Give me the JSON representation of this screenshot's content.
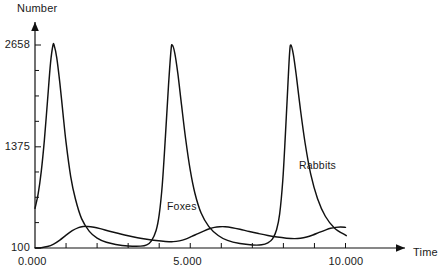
{
  "chart_data": {
    "type": "line",
    "title": "",
    "xlabel": "Time",
    "ylabel": "Number",
    "xlim": [
      0.0,
      12.9
    ],
    "ylim": [
      100,
      2990
    ],
    "grid": false,
    "legend_position": "inline-annotations",
    "x_ticks": [
      {
        "value": 0.0,
        "label": "0.000",
        "labeled": true
      },
      {
        "value": 1.0,
        "label": "",
        "labeled": false
      },
      {
        "value": 2.0,
        "label": "",
        "labeled": false
      },
      {
        "value": 3.0,
        "label": "",
        "labeled": false
      },
      {
        "value": 4.0,
        "label": "",
        "labeled": false
      },
      {
        "value": 5.0,
        "label": "5.000",
        "labeled": true
      },
      {
        "value": 6.0,
        "label": "",
        "labeled": false
      },
      {
        "value": 7.0,
        "label": "",
        "labeled": false
      },
      {
        "value": 8.0,
        "label": "",
        "labeled": false
      },
      {
        "value": 9.0,
        "label": "",
        "labeled": false
      },
      {
        "value": 10.0,
        "label": "10.000",
        "labeled": true
      }
    ],
    "y_ticks": [
      {
        "value": 100,
        "label": "100",
        "labeled": true
      },
      {
        "value": 420,
        "label": "",
        "labeled": false
      },
      {
        "value": 739,
        "label": "",
        "labeled": false
      },
      {
        "value": 1058,
        "label": "",
        "labeled": false
      },
      {
        "value": 1375,
        "label": "1375",
        "labeled": true
      },
      {
        "value": 1696,
        "label": "",
        "labeled": false
      },
      {
        "value": 2016,
        "label": "",
        "labeled": false
      },
      {
        "value": 2337,
        "label": "",
        "labeled": false
      },
      {
        "value": 2658,
        "label": "2658",
        "labeled": true
      }
    ],
    "axis_arrows": {
      "x": true,
      "y": true
    },
    "series": [
      {
        "name": "Rabbits",
        "annotation": "Rabbits",
        "annotation_at": {
          "x": 8.7,
          "y": 1100
        },
        "color": "#111111",
        "points": [
          [
            0.0,
            600
          ],
          [
            0.1,
            780
          ],
          [
            0.2,
            1060
          ],
          [
            0.3,
            1450
          ],
          [
            0.4,
            1940
          ],
          [
            0.5,
            2430
          ],
          [
            0.58,
            2658
          ],
          [
            0.62,
            2650
          ],
          [
            0.7,
            2500
          ],
          [
            0.8,
            2180
          ],
          [
            0.9,
            1800
          ],
          [
            1.0,
            1430
          ],
          [
            1.15,
            1000
          ],
          [
            1.3,
            720
          ],
          [
            1.5,
            470
          ],
          [
            1.75,
            310
          ],
          [
            2.0,
            225
          ],
          [
            2.3,
            172
          ],
          [
            2.6,
            145
          ],
          [
            3.0,
            126
          ],
          [
            3.4,
            124
          ],
          [
            3.6,
            140
          ],
          [
            3.75,
            190
          ],
          [
            3.9,
            320
          ],
          [
            4.0,
            520
          ],
          [
            4.1,
            900
          ],
          [
            4.2,
            1500
          ],
          [
            4.3,
            2150
          ],
          [
            4.38,
            2590
          ],
          [
            4.42,
            2658
          ],
          [
            4.5,
            2560
          ],
          [
            4.6,
            2300
          ],
          [
            4.72,
            1900
          ],
          [
            4.85,
            1480
          ],
          [
            5.0,
            1080
          ],
          [
            5.15,
            790
          ],
          [
            5.35,
            540
          ],
          [
            5.6,
            370
          ],
          [
            5.9,
            258
          ],
          [
            6.2,
            196
          ],
          [
            6.6,
            156
          ],
          [
            7.0,
            138
          ],
          [
            7.3,
            140
          ],
          [
            7.5,
            165
          ],
          [
            7.65,
            215
          ],
          [
            7.78,
            330
          ],
          [
            7.88,
            530
          ],
          [
            7.98,
            950
          ],
          [
            8.06,
            1500
          ],
          [
            8.14,
            2120
          ],
          [
            8.2,
            2560
          ],
          [
            8.24,
            2658
          ],
          [
            8.32,
            2540
          ],
          [
            8.42,
            2260
          ],
          [
            8.55,
            1840
          ],
          [
            8.7,
            1420
          ],
          [
            8.88,
            1030
          ],
          [
            9.1,
            720
          ],
          [
            9.35,
            500
          ],
          [
            9.65,
            350
          ],
          [
            10.0,
            262
          ],
          [
            10.0,
            262
          ]
        ]
      },
      {
        "name": "Foxes",
        "annotation": "Foxes",
        "annotation_at": {
          "x": 4.3,
          "y": 470
        },
        "color": "#111111",
        "points": [
          [
            0.0,
            100
          ],
          [
            0.2,
            104
          ],
          [
            0.4,
            118
          ],
          [
            0.6,
            150
          ],
          [
            0.8,
            200
          ],
          [
            1.0,
            262
          ],
          [
            1.2,
            318
          ],
          [
            1.4,
            356
          ],
          [
            1.55,
            370
          ],
          [
            1.7,
            372
          ],
          [
            1.9,
            362
          ],
          [
            2.1,
            344
          ],
          [
            2.4,
            312
          ],
          [
            2.7,
            282
          ],
          [
            3.0,
            254
          ],
          [
            3.3,
            230
          ],
          [
            3.6,
            210
          ],
          [
            3.9,
            194
          ],
          [
            4.2,
            183
          ],
          [
            4.45,
            180
          ],
          [
            4.65,
            190
          ],
          [
            4.85,
            212
          ],
          [
            5.05,
            246
          ],
          [
            5.25,
            282
          ],
          [
            5.45,
            316
          ],
          [
            5.62,
            342
          ],
          [
            5.78,
            360
          ],
          [
            5.95,
            368
          ],
          [
            6.12,
            368
          ],
          [
            6.35,
            356
          ],
          [
            6.6,
            336
          ],
          [
            6.9,
            308
          ],
          [
            7.2,
            282
          ],
          [
            7.5,
            258
          ],
          [
            7.8,
            238
          ],
          [
            8.1,
            224
          ],
          [
            8.35,
            218
          ],
          [
            8.55,
            222
          ],
          [
            8.75,
            238
          ],
          [
            8.95,
            264
          ],
          [
            9.15,
            296
          ],
          [
            9.35,
            326
          ],
          [
            9.52,
            348
          ],
          [
            9.68,
            360
          ],
          [
            9.84,
            364
          ],
          [
            10.0,
            360
          ]
        ]
      }
    ]
  },
  "annotations": {
    "ylabel": "Number",
    "xlabel": "Time"
  }
}
